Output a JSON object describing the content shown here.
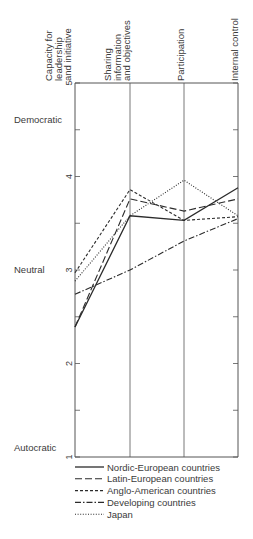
{
  "chart_data": {
    "type": "line",
    "title": "",
    "xlabel": "",
    "ylabel": "",
    "ylim": [
      1,
      5
    ],
    "yticks": [
      1,
      2,
      3,
      4,
      5
    ],
    "ytick_labels": [
      "1",
      "2",
      "3",
      "4",
      "5"
    ],
    "y_category_labels": [
      {
        "value": 4.6,
        "label": "Democratic"
      },
      {
        "value": 3.0,
        "label": "Neutral"
      },
      {
        "value": 1.1,
        "label": "Autocratic"
      }
    ],
    "categories": [
      "Capacity for leadership and initiative",
      "Sharing information and objectives",
      "Participation",
      "Internal control"
    ],
    "category_label_lines": [
      [
        "Capacity for",
        "leadership",
        "and initiative"
      ],
      [
        "Sharing",
        "information",
        "and objectives"
      ],
      [
        "Participation"
      ],
      [
        "Internal control"
      ]
    ],
    "grid": false,
    "legend_position": "bottom",
    "series": [
      {
        "name": "Nordic-European countries",
        "style": "solid",
        "values": [
          2.39,
          3.58,
          3.53,
          3.88
        ]
      },
      {
        "name": "Latin-European countries",
        "style": "longdash",
        "values": [
          2.39,
          3.76,
          3.63,
          3.76
        ]
      },
      {
        "name": "Anglo-American countries",
        "style": "dashed",
        "values": [
          2.97,
          3.86,
          3.53,
          3.57
        ]
      },
      {
        "name": "Developing countries",
        "style": "dashdot",
        "values": [
          2.74,
          3.0,
          3.31,
          3.55
        ]
      },
      {
        "name": "Japan",
        "style": "dotted",
        "values": [
          2.88,
          3.58,
          3.96,
          3.58
        ]
      }
    ]
  },
  "colors": {
    "line": "#2b2b2b",
    "axis": "#555555",
    "text": "#3a3a3a"
  }
}
